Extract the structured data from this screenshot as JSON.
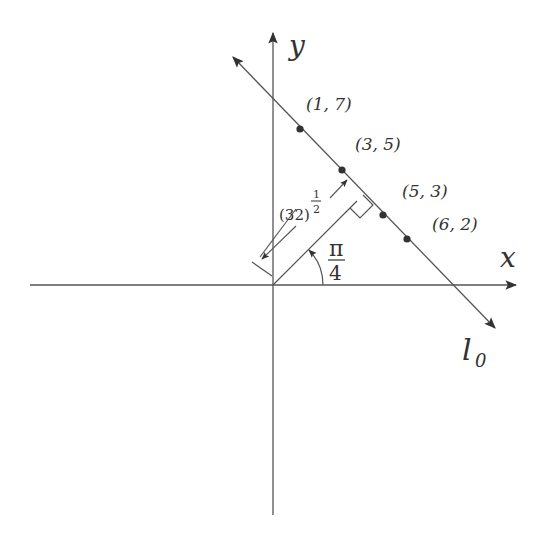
{
  "diagram": {
    "axes": {
      "x_label": "x",
      "y_label": "y"
    },
    "line": {
      "label_main": "l",
      "label_sub": "0"
    },
    "points": [
      {
        "label": "(1, 7)",
        "x": 1,
        "y": 7
      },
      {
        "label": "(3, 5)",
        "x": 3,
        "y": 5
      },
      {
        "label": "(5, 3)",
        "x": 5,
        "y": 3
      },
      {
        "label": "(6, 2)",
        "x": 6,
        "y": 2
      }
    ],
    "normal_distance": {
      "base": "(32)",
      "exp_num": "1",
      "exp_den": "2"
    },
    "angle": {
      "num": "π",
      "den": "4"
    },
    "colors": {
      "stroke": "#555555",
      "text": "#333333",
      "fill": "#333333"
    }
  }
}
